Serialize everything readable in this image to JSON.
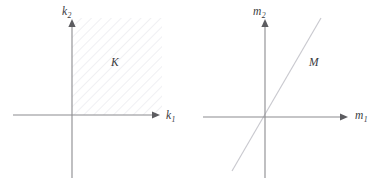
{
  "figure": {
    "type": "math-diagram",
    "background_color": "#ffffff",
    "axis_color": "#8b8b8f",
    "curve_color": "#c9c9cf",
    "label_color": "#3a3a3e"
  },
  "panels": [
    {
      "id": "left",
      "name": "cone-K-diagram",
      "origin": {
        "x": 72,
        "y": 115
      },
      "axes": {
        "horizontal": {
          "label_base": "k",
          "label_sub": "1",
          "x_start": 13,
          "x_end": 158,
          "arrow": "right"
        },
        "vertical": {
          "label_base": "k",
          "label_sub": "2",
          "y_start": 178,
          "y_end": 20,
          "arrow": "up"
        }
      },
      "set": {
        "label": "K",
        "shape": "hatched-square",
        "hatch_angle_deg": 45,
        "bounds": {
          "left": 72,
          "top": 18,
          "right": 162,
          "bottom": 115
        }
      }
    },
    {
      "id": "right",
      "name": "line-M-diagram",
      "origin": {
        "x": 265,
        "y": 117
      },
      "axes": {
        "horizontal": {
          "label_base": "m",
          "label_sub": "1",
          "x_start": 203,
          "x_end": 348,
          "arrow": "right"
        },
        "vertical": {
          "label_base": "m",
          "label_sub": "2",
          "y_start": 178,
          "y_end": 20,
          "arrow": "up"
        }
      },
      "set": {
        "label": "M",
        "shape": "line-through-origin",
        "endpoints": [
          {
            "x": 232,
            "y": 171
          },
          {
            "x": 321,
            "y": 18
          }
        ]
      }
    }
  ],
  "labels": {
    "k_axis_base": "k",
    "k1_sub": "1",
    "k2_sub": "2",
    "m_axis_base": "m",
    "m1_sub": "1",
    "m2_sub": "2",
    "set_K": "K",
    "set_M": "M"
  }
}
